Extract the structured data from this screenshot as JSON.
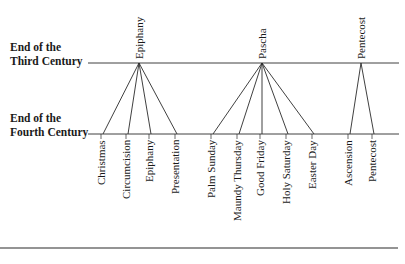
{
  "rows": {
    "third": {
      "line1": "End of the",
      "line2": "Third Century"
    },
    "fourth": {
      "line1": "End of the",
      "line2": "Fourth Century"
    }
  },
  "top_feasts": [
    {
      "label": "Epiphany",
      "x": 139
    },
    {
      "label": "Pascha",
      "x": 262
    },
    {
      "label": "Pentecost",
      "x": 361
    }
  ],
  "bottom_feasts": [
    {
      "label": "Christmas",
      "x": 103,
      "parent": 0
    },
    {
      "label": "Circumcision",
      "x": 128,
      "parent": 0
    },
    {
      "label": "Epiphany",
      "x": 151,
      "parent": 0
    },
    {
      "label": "Presentation",
      "x": 177,
      "parent": 0
    },
    {
      "label": "Palm Sunday",
      "x": 213,
      "parent": 1
    },
    {
      "label": "Maundy Thursday",
      "x": 239,
      "parent": 1
    },
    {
      "label": "Good Friday",
      "x": 262,
      "parent": 1
    },
    {
      "label": "Holy Saturday",
      "x": 288,
      "parent": 1
    },
    {
      "label": "Easter Day",
      "x": 314,
      "parent": 1
    },
    {
      "label": "Ascension",
      "x": 350,
      "parent": 2
    },
    {
      "label": "Pentecost",
      "x": 374,
      "parent": 2
    }
  ],
  "layout": {
    "third_line_y": 63,
    "fourth_line_y": 134,
    "line_x_start": 88,
    "line_x_end": 399,
    "footer_line_y": 248
  }
}
